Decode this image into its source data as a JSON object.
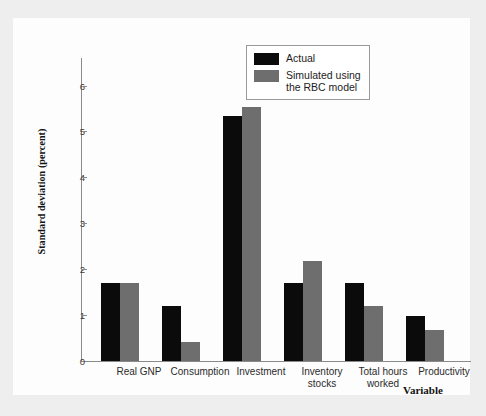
{
  "chart_data": {
    "type": "bar",
    "title": "",
    "xlabel": "Variable",
    "ylabel": "Standard deviation (percent)",
    "ylim": [
      0,
      6.6
    ],
    "yticks": [
      0,
      1,
      2,
      3,
      4,
      5,
      6
    ],
    "ytick_labels": [
      "0",
      "1",
      "2",
      "3",
      "4",
      "5",
      "6"
    ],
    "grid": false,
    "legend_position": "top-right",
    "categories": [
      "Real GNP",
      "Consumption",
      "Investment",
      "Inventory\nstocks",
      "Total hours\nworked",
      "Productivity"
    ],
    "series": [
      {
        "name": "Actual",
        "color": "#0b0b0b",
        "values": [
          1.7,
          1.2,
          5.33,
          1.7,
          1.7,
          0.97
        ]
      },
      {
        "name": "Simulated using\nthe RBC model",
        "color": "#6e6e6e",
        "values": [
          1.7,
          0.42,
          5.53,
          2.18,
          1.2,
          0.67
        ]
      }
    ]
  },
  "legend": {
    "entries": [
      {
        "label": "Actual",
        "swatch": "actual"
      },
      {
        "label": "Simulated using\nthe RBC model",
        "swatch": "sim"
      }
    ]
  },
  "colors": {
    "actual": "#0b0b0b",
    "simulated": "#6e6e6e",
    "axis": "#8a8a8a",
    "page_background": "#eeeeee",
    "plate_background": "#fdfdfd"
  }
}
